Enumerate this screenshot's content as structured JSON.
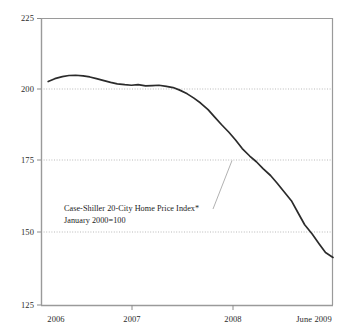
{
  "chart_data": {
    "type": "line",
    "title": "",
    "subtitle": "",
    "xlabel": "",
    "ylabel": "",
    "ylim": [
      125,
      225
    ],
    "yticks": [
      225,
      200,
      175,
      150,
      125
    ],
    "ytick_labels": [
      "225",
      "200",
      "175",
      "150",
      "125"
    ],
    "xticks": [
      2006,
      2007,
      2008,
      2009.42
    ],
    "xtick_labels": [
      "2006",
      "2007",
      "2008",
      "June 2009"
    ],
    "xlim": [
      2005.92,
      2009.42
    ],
    "grid": "horizontal-dotted",
    "legend": "none",
    "annotations": [
      {
        "name": "series-annotation",
        "lines": [
          "Case-Shiller 20-City Home Price Index*",
          "January 2000=100"
        ],
        "points_to": {
          "x": 2008.0,
          "y": 175.0
        }
      }
    ],
    "series": [
      {
        "name": "Case-Shiller 20-City Home Price Index",
        "color": "#2b2b2b",
        "x": [
          2006.0,
          2006.08,
          2006.17,
          2006.25,
          2006.33,
          2006.42,
          2006.5,
          2006.58,
          2006.67,
          2006.75,
          2006.83,
          2006.92,
          2007.0,
          2007.08,
          2007.17,
          2007.25,
          2007.33,
          2007.42,
          2007.5,
          2007.58,
          2007.67,
          2007.75,
          2007.83,
          2007.92,
          2008.0,
          2008.08,
          2008.17,
          2008.25,
          2008.33,
          2008.42,
          2008.5,
          2008.58,
          2008.67,
          2008.75,
          2008.83,
          2008.92,
          2009.0,
          2009.08,
          2009.17,
          2009.25,
          2009.33,
          2009.42
        ],
        "values": [
          203.0,
          204.0,
          204.7,
          205.1,
          205.2,
          205.0,
          204.6,
          204.0,
          203.3,
          202.7,
          202.2,
          201.9,
          201.7,
          201.9,
          201.5,
          201.6,
          201.7,
          201.3,
          200.9,
          200.0,
          198.7,
          197.2,
          195.5,
          193.2,
          190.6,
          188.0,
          185.3,
          182.6,
          179.6,
          177.0,
          175.0,
          172.6,
          170.2,
          167.5,
          164.6,
          161.4,
          157.2,
          153.0,
          149.8,
          146.5,
          143.3,
          141.6
        ]
      }
    ]
  },
  "axes": {
    "y_labels": [
      "225",
      "200",
      "175",
      "150",
      "125"
    ],
    "x_labels": [
      "2006",
      "2007",
      "2008",
      "June 2009"
    ]
  },
  "annotation": {
    "line1": "Case-Shiller 20-City Home Price Index*",
    "line2": "January 2000=100"
  },
  "colors": {
    "series": "#2b2b2b",
    "axis": "#8c8c8c",
    "grid": "#b9b9b9",
    "text": "#2b2b2b",
    "background": "#ffffff",
    "leader": "#a8a8a8"
  }
}
